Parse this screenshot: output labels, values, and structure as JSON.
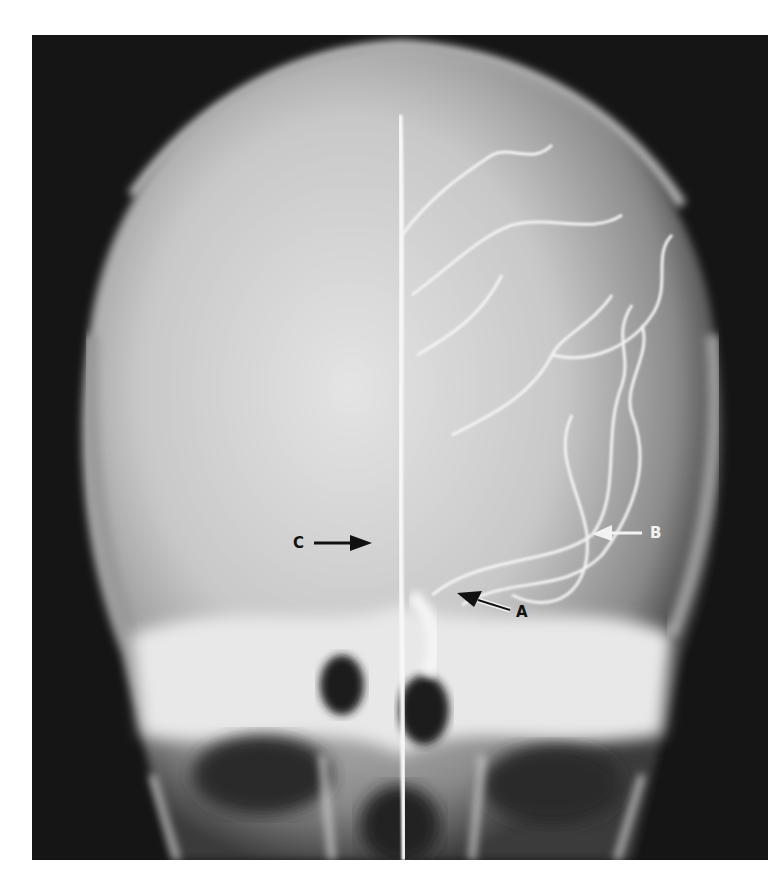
{
  "figure": {
    "type": "angiogram",
    "view": "frontal skull radiograph with contrast-filled arteries",
    "colors": {
      "background": "#151515",
      "skull": "#d8d8d8",
      "vessel": "#f5f5f5",
      "page": "#ffffff"
    }
  },
  "annotations": [
    {
      "letter": "A",
      "arrow_direction": "left-up",
      "label_color": "dark"
    },
    {
      "letter": "B",
      "arrow_direction": "left",
      "label_color": "light"
    },
    {
      "letter": "C",
      "arrow_direction": "right",
      "label_color": "dark"
    }
  ]
}
